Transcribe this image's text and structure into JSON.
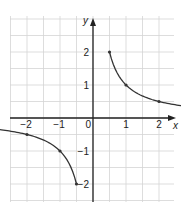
{
  "chart_data": {
    "type": "line",
    "title": "",
    "xlabel": "x",
    "ylabel": "y",
    "xlim": [
      -5,
      5
    ],
    "ylim": [
      -2.5,
      3
    ],
    "grid": true,
    "grid_step": 0.5,
    "x_ticks": [
      -4,
      -3,
      -2,
      -1,
      1,
      2,
      3,
      4
    ],
    "y_ticks": [
      2,
      1,
      -1,
      -2
    ],
    "origin_label": "0",
    "series": [
      {
        "name": "branch-positive",
        "x": [
          0.5,
          1,
          2,
          3,
          4
        ],
        "y": [
          2,
          1,
          0.5,
          0.333,
          0.25
        ]
      },
      {
        "name": "branch-negative",
        "x": [
          -4,
          -3,
          -2,
          -1,
          -0.5
        ],
        "y": [
          -0.25,
          -0.333,
          -0.5,
          -1,
          -2
        ]
      }
    ],
    "function": "y = 1/x"
  },
  "colors": {
    "grid": "#d4d4d4",
    "axis": "#222222",
    "curve": "#333333",
    "text": "#222222"
  },
  "layout": {
    "origin_px": [
      93,
      118
    ],
    "unit_px": 33,
    "grid_left": 10,
    "grid_right": 174,
    "grid_top": 16,
    "grid_bottom": 202
  }
}
